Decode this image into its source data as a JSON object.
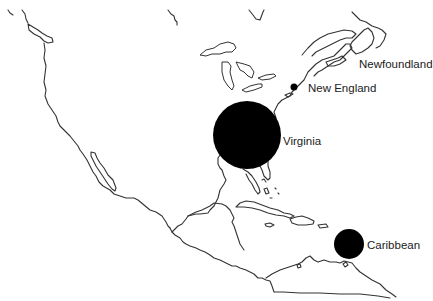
{
  "map": {
    "type": "bubble-map",
    "region": "North America and Caribbean",
    "marker_color": "#000000",
    "coastline_color": "#333333",
    "background": "#ffffff",
    "markers": [
      {
        "label": "Newfoundland",
        "cx": null,
        "cy": null,
        "r": 0
      },
      {
        "label": "New England",
        "cx": 294,
        "cy": 87,
        "r": 3.5
      },
      {
        "label": "Virginia",
        "cx": 247,
        "cy": 135,
        "r": 34
      },
      {
        "label": "Caribbean",
        "cx": 349,
        "cy": 244,
        "r": 15
      }
    ]
  },
  "labels": {
    "newfoundland": "Newfoundland",
    "new_england": "New England",
    "virginia": "Virginia",
    "caribbean": "Caribbean"
  }
}
